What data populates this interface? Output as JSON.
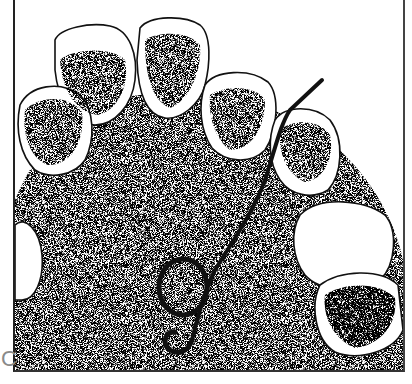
{
  "figure": {
    "label": "C",
    "colors": {
      "ink": "#111111",
      "stipple": "#555555",
      "background": "#ffffff",
      "label": "#8a8a8a"
    }
  }
}
